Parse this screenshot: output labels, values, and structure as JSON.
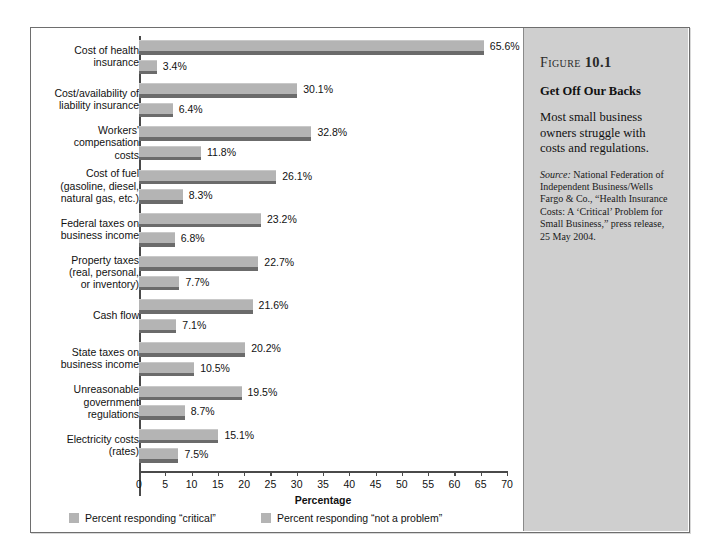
{
  "chart_data": {
    "type": "bar",
    "orientation": "horizontal",
    "title": "Get Off Our Backs",
    "xlabel": "Percentage",
    "ylabel": "",
    "xlim": [
      0,
      70
    ],
    "xticks": [
      0,
      5,
      10,
      15,
      20,
      25,
      30,
      35,
      40,
      45,
      50,
      55,
      60,
      65,
      70
    ],
    "grid": false,
    "legend_position": "bottom-left",
    "categories": [
      "Cost of health insurance",
      "Cost/availability of liability insurance",
      "Workers' compensation costs",
      "Cost of fuel (gasoline, diesel, natural gas, etc.)",
      "Federal taxes on business income",
      "Property taxes (real, personal, or inventory)",
      "Cash flow",
      "State taxes on business income",
      "Unreasonable government regulations",
      "Electricity costs (rates)"
    ],
    "series": [
      {
        "name": "Percent responding “critical”",
        "color": "#b4b4b4",
        "values": [
          65.6,
          30.1,
          32.8,
          26.1,
          23.2,
          22.7,
          21.6,
          20.2,
          19.5,
          15.1
        ],
        "labels": [
          "65.6%",
          "30.1%",
          "32.8%",
          "26.1%",
          "23.2%",
          "22.7%",
          "21.6%",
          "20.2%",
          "19.5%",
          "15.1%"
        ]
      },
      {
        "name": "Percent responding “not a problem”",
        "color": "#b4b4b4",
        "values": [
          3.4,
          6.4,
          11.8,
          8.3,
          6.8,
          7.7,
          7.1,
          10.5,
          8.7,
          7.5
        ],
        "labels": [
          "3.4%",
          "6.4%",
          "11.8%",
          "8.3%",
          "6.8%",
          "7.7%",
          "7.1%",
          "10.5%",
          "8.7%",
          "7.5%"
        ]
      }
    ]
  },
  "category_lines": [
    [
      "Cost of health",
      "insurance"
    ],
    [
      "Cost/availability of",
      "liability insurance"
    ],
    [
      "Workers'",
      "compensation",
      "costs"
    ],
    [
      "Cost of fuel",
      "(gasoline, diesel,",
      "natural gas, etc.)"
    ],
    [
      "Federal taxes on",
      "business income"
    ],
    [
      "Property taxes",
      "(real, personal,",
      "or inventory)"
    ],
    [
      "Cash flow"
    ],
    [
      "State taxes on",
      "business income"
    ],
    [
      "Unreasonable",
      "government",
      "regulations"
    ],
    [
      "Electricity costs",
      "(rates)"
    ]
  ],
  "axis": {
    "title": "Percentage",
    "tick_labels": [
      "0",
      "5",
      "10",
      "15",
      "20",
      "25",
      "30",
      "35",
      "40",
      "45",
      "50",
      "55",
      "60",
      "65",
      "70"
    ]
  },
  "legend": {
    "items": [
      {
        "label": "Percent responding “critical”",
        "color": "#b4b4b4"
      },
      {
        "label": "Percent responding “not a problem”",
        "color": "#b4b4b4"
      }
    ]
  },
  "sidebar": {
    "figure_word": "Figure",
    "figure_number": "10.1",
    "title": "Get Off Our Backs",
    "description": "Most small business owners struggle with costs and regulations.",
    "source_label": "Source:",
    "source_text": " National Federation of Independent Business/Wells Fargo & Co., “Health Insurance Costs: A ‘Critical’ Problem for Small Business,” press release, 25 May 2004."
  },
  "colors": {
    "bar_fill": "#b4b4b4",
    "bar_shadow": "#6b6b6b",
    "sidebar_bg": "#cfcfcf",
    "frame_border": "#6e6e6e",
    "axis": "#4a4a4a"
  }
}
